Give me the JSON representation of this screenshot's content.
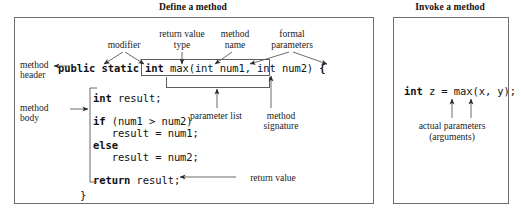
{
  "panels": {
    "define": {
      "title": "Define a method",
      "side_labels": [
        {
          "name": "method-header",
          "line1": "method",
          "line2": "header"
        },
        {
          "name": "method-body",
          "line1": "method",
          "line2": "body"
        }
      ],
      "callouts_top": [
        {
          "name": "modifier",
          "line1": "modifier",
          "line2": ""
        },
        {
          "name": "return-value-type",
          "line1": "return value",
          "line2": "type"
        },
        {
          "name": "method-name",
          "line1": "method",
          "line2": "name"
        },
        {
          "name": "formal-parameters",
          "line1": "formal",
          "line2": "parameters"
        }
      ],
      "callouts_bottom": [
        {
          "name": "parameter-list",
          "line1": "parameter list",
          "line2": ""
        },
        {
          "name": "method-signature",
          "line1": "method",
          "line2": "signature"
        }
      ],
      "return_value_label": "return value",
      "code": {
        "header_modifier": "public static int ",
        "header_signature": "max(int num1, int num2)",
        "header_brace": " {",
        "body_line_1": "int result;",
        "body_line_2": "",
        "body_line_3": "if (num1 > num2)",
        "body_line_4": "   result = num1;",
        "body_line_5": "else",
        "body_line_6": "   result = num2;",
        "body_line_7": "",
        "body_line_8": "return result;",
        "closing_brace": "}"
      }
    },
    "invoke": {
      "title": "Invoke a method",
      "code_line": "int z = max(x, y);",
      "callout": {
        "line1": "actual parameters",
        "line2": "(arguments)"
      }
    }
  },
  "colors": {
    "ink": "#1b1b1b",
    "rule": "#6f6f6f",
    "box": "#5d5d5d",
    "background": "#ffffff"
  }
}
